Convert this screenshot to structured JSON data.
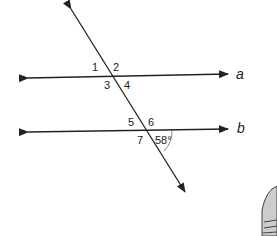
{
  "diagram": {
    "type": "parallel-lines-transversal",
    "lines": [
      {
        "name": "a"
      },
      {
        "name": "b"
      }
    ],
    "angle_labels_line_a": [
      "1",
      "2",
      "3",
      "4"
    ],
    "angle_labels_line_b": [
      "5",
      "6",
      "7"
    ],
    "given_angle": "58°"
  }
}
